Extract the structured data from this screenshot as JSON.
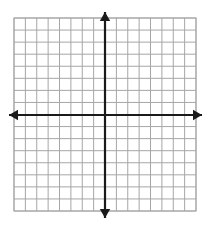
{
  "figure": {
    "kind": "blank-cartesian-coordinate-plane",
    "title": "",
    "background_color": "#ffffff",
    "width": 210,
    "height": 227
  },
  "chart_data": {
    "type": "scatter",
    "title": "",
    "subtitle": "",
    "xlabel": "",
    "ylabel": "",
    "x": [],
    "y": [],
    "series": [],
    "annotations": [],
    "legend": null,
    "legend_position": "none",
    "grid": true,
    "xlim": [
      -8,
      8
    ],
    "ylim": [
      -8,
      8
    ],
    "xticks": [
      -8,
      -7,
      -6,
      -5,
      -4,
      -3,
      -2,
      -1,
      0,
      1,
      2,
      3,
      4,
      5,
      6,
      7,
      8
    ],
    "yticks": [
      -8,
      -7,
      -6,
      -5,
      -4,
      -3,
      -2,
      -1,
      0,
      1,
      2,
      3,
      4,
      5,
      6,
      7,
      8
    ],
    "xtick_labels": [],
    "ytick_labels": [],
    "tick_labels_visible": false,
    "columns_count": 16,
    "rows_count": 16,
    "origin_column_index": 8,
    "origin_row_index": 8
  },
  "grid": {
    "left": 14,
    "top": 18,
    "right": 196,
    "bottom": 211,
    "columns": 16,
    "rows": 16,
    "cell_width": 11.375,
    "cell_height": 12.0625,
    "line_color": "#a6a6a6",
    "line_width": 1,
    "border_color": "#a6a6a6"
  },
  "axes": {
    "color": "#1a1a1a",
    "line_width": 2.2,
    "arrowhead": true,
    "origin_x": 105,
    "origin_y": 115,
    "x_axis": {
      "label": "",
      "start_x": 9,
      "end_x": 202,
      "y": 115,
      "left_arrow": true,
      "right_arrow": true
    },
    "y_axis": {
      "label": "",
      "x": 105,
      "start_y": 12,
      "end_y": 218,
      "up_arrow": true,
      "down_arrow": true
    }
  },
  "labels": {
    "x_axis_name": "x-axis",
    "y_axis_name": "y-axis",
    "origin_name": "origin",
    "quadrant_1": "",
    "quadrant_2": "",
    "quadrant_3": "",
    "quadrant_4": ""
  }
}
